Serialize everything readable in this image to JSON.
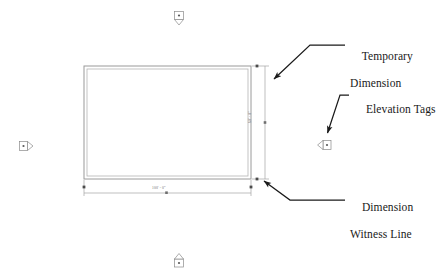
{
  "view": {
    "title": "Revit floor plan with annotation callouts",
    "background_color": "#ffffff",
    "line_color_model": "#9a9a9a",
    "line_color_annotation": "#8c8c8c",
    "text_color": "#191919",
    "dimension_text_color": "#6a6a6a",
    "leader_color": "#1a1a1a"
  },
  "model": {
    "walls_name": "rectangular-wall-outline",
    "wall_outer": {
      "x": 84,
      "y": 66,
      "width": 167,
      "height": 113
    },
    "wall_inner": {
      "x": 87,
      "y": 69,
      "width": 161,
      "height": 107
    }
  },
  "dimensions": {
    "horizontal": {
      "label": "100' - 0\"",
      "name": "horizontal-dimension",
      "line_y": 193,
      "x_start": 84,
      "x_end": 251
    },
    "vertical": {
      "label": "60' - 0\"",
      "name": "vertical-dimension",
      "line_x": 265,
      "y_start": 66,
      "y_end": 179
    }
  },
  "elevation_tags": [
    {
      "name": "elevation-tag-north",
      "position": "top",
      "x": 179,
      "y": 17,
      "glyph": "north-elevation-marker"
    },
    {
      "name": "elevation-tag-west",
      "position": "left",
      "x": 24,
      "y": 146,
      "glyph": "west-elevation-marker"
    },
    {
      "name": "elevation-tag-east",
      "position": "right",
      "x": 326,
      "y": 145,
      "glyph": "east-elevation-marker"
    },
    {
      "name": "elevation-tag-south",
      "position": "bottom",
      "x": 179,
      "y": 261,
      "glyph": "south-elevation-marker"
    }
  ],
  "callouts": [
    {
      "name": "callout-temporary-dimension",
      "line1": "Temporary",
      "line2": "Dimension",
      "text_x": 350,
      "text_y": 36,
      "leader": {
        "name": "leader-temporary-dimension",
        "points": "345,45 310,45 271,82",
        "arrow_at": "271,82",
        "arrow_angle": 223
      }
    },
    {
      "name": "callout-elevation-tags",
      "line1": "Elevation Tags",
      "line2": "",
      "text_x": 354,
      "text_y": 89,
      "leader": {
        "name": "leader-elevation-tags",
        "points": "349,95 339,95 326,136",
        "arrow_at": "326,136",
        "arrow_angle": 252
      }
    },
    {
      "name": "callout-dimension-witness-line",
      "line1": "Dimension",
      "line2": "Witness Line",
      "text_x": 350,
      "text_y": 187,
      "leader": {
        "name": "leader-dimension-witness-line",
        "points": "345,200 290,200 262,178",
        "arrow_at": "262,178",
        "arrow_angle": 322
      }
    }
  ]
}
